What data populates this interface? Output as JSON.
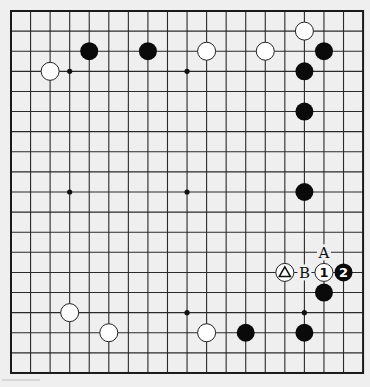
{
  "board": {
    "size": 19,
    "origin_x": 11,
    "origin_y": 11,
    "spacing_x": 19.56,
    "spacing_y": 20.11,
    "background": "#efefef",
    "line_color": "#2a2a2a",
    "hoshi": [
      [
        3,
        3
      ],
      [
        9,
        3
      ],
      [
        15,
        3
      ],
      [
        3,
        9
      ],
      [
        9,
        9
      ],
      [
        15,
        9
      ],
      [
        3,
        15
      ],
      [
        9,
        15
      ],
      [
        15,
        15
      ]
    ],
    "visible_hoshi": [
      [
        3,
        3
      ],
      [
        9,
        3
      ],
      [
        3,
        9
      ],
      [
        9,
        9
      ],
      [
        9,
        15
      ],
      [
        15,
        15
      ]
    ]
  },
  "stones": [
    {
      "color": "black",
      "col": 4,
      "row": 2
    },
    {
      "color": "black",
      "col": 7,
      "row": 2
    },
    {
      "color": "white",
      "col": 10,
      "row": 2
    },
    {
      "color": "white",
      "col": 13,
      "row": 2
    },
    {
      "color": "white",
      "col": 15,
      "row": 1
    },
    {
      "color": "black",
      "col": 16,
      "row": 2
    },
    {
      "color": "white",
      "col": 2,
      "row": 3
    },
    {
      "color": "black",
      "col": 15,
      "row": 3
    },
    {
      "color": "black",
      "col": 15,
      "row": 5
    },
    {
      "color": "black",
      "col": 15,
      "row": 9
    },
    {
      "color": "black",
      "col": 16,
      "row": 14
    },
    {
      "color": "white",
      "col": 3,
      "row": 15
    },
    {
      "color": "white",
      "col": 5,
      "row": 16
    },
    {
      "color": "white",
      "col": 10,
      "row": 16
    },
    {
      "color": "black",
      "col": 12,
      "row": 16
    },
    {
      "color": "black",
      "col": 15,
      "row": 16
    },
    {
      "color": "white",
      "col": 14,
      "row": 13,
      "mark": "triangle"
    },
    {
      "color": "white",
      "col": 16,
      "row": 13,
      "label": "1"
    },
    {
      "color": "black",
      "col": 17,
      "row": 13,
      "label": "2"
    }
  ],
  "letters": [
    {
      "text": "A",
      "col": 16,
      "row": 12
    },
    {
      "text": "B",
      "col": 15,
      "row": 13
    }
  ],
  "moves": [
    {
      "number": "1",
      "color": "white",
      "point": "col16-row13"
    },
    {
      "number": "2",
      "color": "black",
      "point": "col17-row13"
    }
  ],
  "marked_stone": {
    "symbol": "triangle",
    "color": "white",
    "point": "col14-row13"
  }
}
